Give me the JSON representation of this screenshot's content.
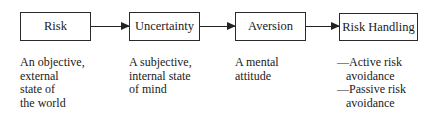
{
  "diagram": {
    "type": "flowchart",
    "nodes": [
      {
        "label": "Risk",
        "description": "An objective,\nexternal\nstate of\nthe world"
      },
      {
        "label": "Uncertainty",
        "description": "A subjective,\ninternal state\nof mind"
      },
      {
        "label": "Aversion",
        "description": "A mental\nattitude"
      },
      {
        "label": "Risk Handling",
        "description": "—Active risk\n   avoidance\n—Passive risk\n   avoidance"
      }
    ],
    "edges": [
      {
        "from": "Risk",
        "to": "Uncertainty"
      },
      {
        "from": "Uncertainty",
        "to": "Aversion"
      },
      {
        "from": "Aversion",
        "to": "Risk Handling"
      }
    ]
  }
}
